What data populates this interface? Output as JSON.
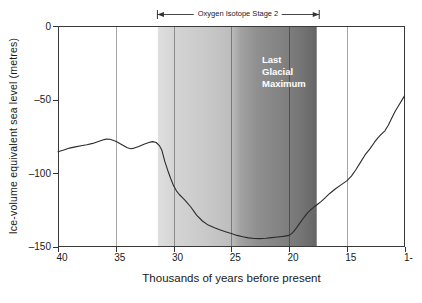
{
  "figure": {
    "background": "#ffffff",
    "frame_color": "#3a3a3a",
    "gridline_color_rgba": "rgba(0,0,0,0.35)"
  },
  "chart_data": {
    "type": "line",
    "title": "",
    "xlabel": "Thousands of years before present",
    "ylabel": "Ice-volume equivalent sea level (metres)",
    "x_axis": {
      "range": [
        40,
        10
      ],
      "ticks": [
        {
          "v": 40,
          "label": "40"
        },
        {
          "v": 35,
          "label": "35"
        },
        {
          "v": 30,
          "label": "30"
        },
        {
          "v": 25,
          "label": "25"
        },
        {
          "v": 20,
          "label": "20"
        },
        {
          "v": 15,
          "label": "15"
        },
        {
          "v": 10,
          "label": "1-"
        }
      ]
    },
    "y_axis": {
      "range": [
        0,
        -150
      ],
      "ticks": [
        {
          "v": 0,
          "label": "0"
        },
        {
          "v": -50,
          "label": "–50"
        },
        {
          "v": -100,
          "label": "–100"
        },
        {
          "v": -150,
          "label": "–150"
        }
      ]
    },
    "gridlines_x": [
      35,
      30,
      25,
      20,
      15
    ],
    "band": {
      "label": "Oxygen Isotope Stage 2",
      "from": 31.35,
      "to": 17.6,
      "inner_label_lines": [
        "Last",
        "Glacial",
        "Maximum"
      ],
      "inner_label_color": "#ffffff",
      "gradient_stops": [
        [
          "0%",
          "#dfdfdf"
        ],
        [
          "12%",
          "#d3d3d3"
        ],
        [
          "30%",
          "#c9c9c9"
        ],
        [
          "46%",
          "#bdbdbd"
        ],
        [
          "52%",
          "#a2a2a2"
        ],
        [
          "62%",
          "#909090"
        ],
        [
          "78%",
          "#828282"
        ],
        [
          "90%",
          "#757575"
        ],
        [
          "100%",
          "#656565"
        ]
      ]
    },
    "series": [
      {
        "name": "ice-volume-equivalent-sea-level",
        "color": "#2b2b2b",
        "points": [
          [
            40.0,
            -85.5
          ],
          [
            39.5,
            -84.3
          ],
          [
            39.0,
            -83.0
          ],
          [
            38.5,
            -82.2
          ],
          [
            38.0,
            -81.4
          ],
          [
            37.5,
            -80.7
          ],
          [
            37.0,
            -79.8
          ],
          [
            36.5,
            -78.5
          ],
          [
            36.0,
            -77.2
          ],
          [
            35.8,
            -76.8
          ],
          [
            35.5,
            -77.0
          ],
          [
            35.0,
            -78.3
          ],
          [
            34.5,
            -80.5
          ],
          [
            34.0,
            -82.8
          ],
          [
            33.7,
            -83.4
          ],
          [
            33.4,
            -83.0
          ],
          [
            33.0,
            -81.8
          ],
          [
            32.5,
            -80.2
          ],
          [
            32.0,
            -78.9
          ],
          [
            31.8,
            -78.6
          ],
          [
            31.5,
            -79.2
          ],
          [
            31.2,
            -81.5
          ],
          [
            31.0,
            -84.5
          ],
          [
            30.75,
            -92.0
          ],
          [
            30.5,
            -98.0
          ],
          [
            30.25,
            -103.5
          ],
          [
            30.0,
            -108.5
          ],
          [
            29.75,
            -112.0
          ],
          [
            29.5,
            -114.5
          ],
          [
            29.25,
            -116.5
          ],
          [
            29.0,
            -118.5
          ],
          [
            28.5,
            -123.0
          ],
          [
            28.0,
            -128.5
          ],
          [
            27.5,
            -132.5
          ],
          [
            27.0,
            -135.3
          ],
          [
            26.5,
            -137.0
          ],
          [
            26.0,
            -138.5
          ],
          [
            25.5,
            -139.8
          ],
          [
            25.0,
            -141.0
          ],
          [
            24.5,
            -142.3
          ],
          [
            24.0,
            -143.3
          ],
          [
            23.5,
            -144.0
          ],
          [
            23.0,
            -144.4
          ],
          [
            22.5,
            -144.5
          ],
          [
            22.0,
            -144.2
          ],
          [
            21.5,
            -143.8
          ],
          [
            21.0,
            -143.4
          ],
          [
            20.5,
            -143.0
          ],
          [
            20.0,
            -142.3
          ],
          [
            19.8,
            -141.3
          ],
          [
            19.6,
            -139.8
          ],
          [
            19.4,
            -137.8
          ],
          [
            19.2,
            -135.5
          ],
          [
            19.0,
            -133.3
          ],
          [
            18.7,
            -130.0
          ],
          [
            18.4,
            -127.0
          ],
          [
            18.1,
            -124.8
          ],
          [
            17.8,
            -122.8
          ],
          [
            17.5,
            -121.0
          ],
          [
            17.2,
            -119.2
          ],
          [
            16.9,
            -117.0
          ],
          [
            16.5,
            -114.0
          ],
          [
            16.0,
            -110.8
          ],
          [
            15.5,
            -108.0
          ],
          [
            15.0,
            -105.3
          ],
          [
            14.6,
            -102.0
          ],
          [
            14.2,
            -97.5
          ],
          [
            13.8,
            -92.5
          ],
          [
            13.4,
            -87.5
          ],
          [
            13.0,
            -83.5
          ],
          [
            12.6,
            -79.0
          ],
          [
            12.3,
            -76.0
          ],
          [
            12.0,
            -73.5
          ],
          [
            11.7,
            -71.2
          ],
          [
            11.4,
            -67.5
          ],
          [
            11.1,
            -62.5
          ],
          [
            10.8,
            -57.8
          ],
          [
            10.5,
            -54.0
          ],
          [
            10.2,
            -50.0
          ],
          [
            10.0,
            -47.5
          ]
        ]
      }
    ]
  }
}
